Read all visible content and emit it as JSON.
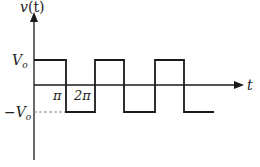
{
  "diagram": {
    "y_axis_label": "v(t)",
    "x_axis_label": "t",
    "levels": {
      "positive": "V_o",
      "negative": "-V_o"
    },
    "tick_labels": [
      "π",
      "2π"
    ],
    "labels": {
      "y_axis_v": "v",
      "y_axis_paren_t": "(t)",
      "pos_V": "V",
      "pos_sub": "o",
      "neg_minus_V": "−V",
      "neg_sub": "o",
      "tick_pi": "π",
      "tick_2pi": "2π",
      "x_axis_t": "t"
    },
    "waveform": {
      "type": "square",
      "starts_at": "+V_o",
      "segments": [
        {
          "from": "0",
          "to": "π",
          "level": "+V_o"
        },
        {
          "from": "π",
          "to": "2π",
          "level": "-V_o"
        },
        {
          "from": "2π",
          "to": "3π",
          "level": "+V_o"
        },
        {
          "from": "3π",
          "to": "4π",
          "level": "-V_o"
        },
        {
          "from": "4π",
          "to": "5π",
          "level": "+V_o"
        },
        {
          "from": "5π",
          "to": "6π",
          "level": "-V_o"
        }
      ]
    },
    "colors": {
      "line": "#1a1a1a",
      "dashed": "#888888",
      "text": "#222222"
    }
  }
}
